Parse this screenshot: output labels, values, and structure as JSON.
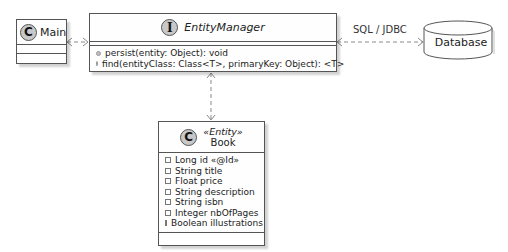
{
  "diagram": {
    "type": "uml-class-diagram",
    "classes": {
      "main": {
        "badge": "C",
        "name": "Main",
        "members": []
      },
      "entity_manager": {
        "badge": "I",
        "name": "EntityManager",
        "methods": [
          "persist(entity: Object): void",
          "find(entityClass: Class<T>, primaryKey: Object): <T>"
        ]
      },
      "book": {
        "badge": "C",
        "stereotype": "«Entity»",
        "name": "Book",
        "fields": [
          "Long id «@Id»",
          "String title",
          "Float price",
          "String description",
          "String isbn",
          "Integer nbOfPages",
          "Boolean illustrations"
        ]
      }
    },
    "database": {
      "label": "Database"
    },
    "links": [
      {
        "from": "Main",
        "to": "EntityManager",
        "style": "dashed",
        "arrows": "both",
        "label": ""
      },
      {
        "from": "EntityManager",
        "to": "Database",
        "style": "dashed",
        "arrows": "both",
        "label": "SQL / JDBC"
      },
      {
        "from": "EntityManager",
        "to": "Book",
        "style": "dashed",
        "arrows": "both",
        "label": ""
      }
    ]
  },
  "colors": {
    "border": "#555555",
    "badge_fill": "#c8c8c8",
    "link": "#888888",
    "background": "#ffffff"
  }
}
